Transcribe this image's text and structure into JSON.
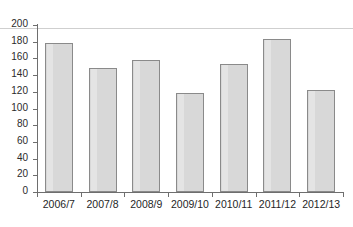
{
  "chart_data": {
    "type": "bar",
    "title": "",
    "subtitle": "",
    "xlabel": "",
    "ylabel": "",
    "categories": [
      "2006/7",
      "2007/8",
      "2008/9",
      "2009/10",
      "2010/11",
      "2011/12",
      "2012/13"
    ],
    "values": [
      179,
      149,
      158,
      119,
      153,
      183,
      122
    ],
    "ylim": [
      0,
      200
    ],
    "y_ticks": [
      0,
      20,
      40,
      60,
      80,
      100,
      120,
      140,
      160,
      180,
      200
    ],
    "y_tick_labels": [
      "0",
      "20",
      "40",
      "60",
      "80",
      "100",
      "120",
      "140",
      "160",
      "180",
      "200"
    ],
    "grid": false,
    "legend": false,
    "legend_position": "none",
    "bar_fill": "#d8d8d8",
    "bar_border": "#8a8a8a",
    "axis_color": "#6e6e6e"
  }
}
